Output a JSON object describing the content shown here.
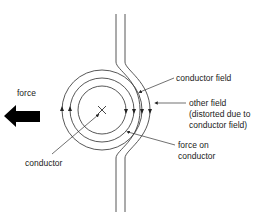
{
  "diagram": {
    "labels": {
      "force": "force",
      "conductor": "conductor",
      "conductor_field": "conductor field",
      "other_field_line1": "other field",
      "other_field_line2": "(distorted due to",
      "other_field_line3": "conductor field)",
      "force_on_line1": "force on",
      "force_on_line2": "conductor"
    },
    "colors": {
      "line": "#333333",
      "arrow": "#000000",
      "background": "#ffffff"
    },
    "conductor_symbol": "×",
    "field_direction": "clockwise",
    "force_direction": "left"
  }
}
